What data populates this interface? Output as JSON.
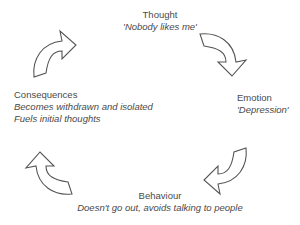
{
  "diagram": {
    "type": "cycle",
    "nodes": [
      {
        "id": "thought",
        "title": "Thought",
        "subtitle": "'Nobody likes me'"
      },
      {
        "id": "emotion",
        "title": "Emotion",
        "subtitle": "'Depression'"
      },
      {
        "id": "behaviour",
        "title": "Behaviour",
        "subtitle": "Doesn't go out, avoids talking to people"
      },
      {
        "id": "consequences",
        "title": "Consequences",
        "subtitle_lines": [
          "Becomes withdrawn and isolated",
          "Fuels initial thoughts"
        ]
      }
    ],
    "edges": [
      {
        "from": "consequences",
        "to": "thought",
        "icon": "curved-arrow-icon"
      },
      {
        "from": "thought",
        "to": "emotion",
        "icon": "curved-arrow-icon"
      },
      {
        "from": "emotion",
        "to": "behaviour",
        "icon": "curved-arrow-icon"
      },
      {
        "from": "behaviour",
        "to": "consequences",
        "icon": "curved-arrow-icon"
      }
    ],
    "colors": {
      "text": "#4a4a4a",
      "arrow_stroke": "#555555",
      "arrow_fill": "#ffffff",
      "background": "#ffffff"
    }
  }
}
